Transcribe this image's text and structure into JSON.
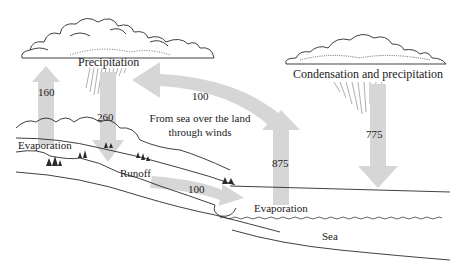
{
  "colors": {
    "arrow": "#d6d6d6",
    "line": "#2a2a2a",
    "background": "#ffffff"
  },
  "clouds": {
    "left_label": "Precipitation",
    "right_label": "Condensation and precipitation"
  },
  "flows": {
    "land_evaporation": {
      "value": "160",
      "direction": "up"
    },
    "land_precipitation": {
      "value": "260",
      "direction": "down"
    },
    "wind_transport": {
      "value": "100",
      "direction": "left"
    },
    "wind_label_line1": "From sea over the land",
    "wind_label_line2": "through winds",
    "runoff": {
      "value": "100",
      "direction": "right"
    },
    "sea_evaporation": {
      "value": "875",
      "direction": "up"
    },
    "sea_precipitation": {
      "value": "775",
      "direction": "down"
    }
  },
  "labels": {
    "land_evaporation": "Evaporation",
    "runoff": "Runoff",
    "sea_evaporation": "Evaporation",
    "sea": "Sea"
  }
}
